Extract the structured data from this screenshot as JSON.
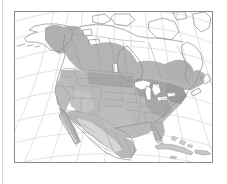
{
  "figure": {
    "type": "map",
    "title": "",
    "caption": "",
    "region": "North America",
    "projection": "conic",
    "background_color": "#ffffff",
    "frame_color": "#8a8a8a",
    "rule_color": "#d9d9d9"
  },
  "map": {
    "name": "north-america-distribution-map",
    "land_outline_color": "#8c8c8c",
    "boundary_color": "#9a9a9a",
    "graticule_color": "#dcdcdc",
    "ocean_color": "#ffffff",
    "lake_color": "#ffffff",
    "unshaded_land_color": "#ffffff",
    "shade_levels": [
      {
        "name": "range-dark",
        "color": "#a8a8a8"
      },
      {
        "name": "range-medium",
        "color": "#bdbdbd"
      },
      {
        "name": "range-light",
        "color": "#d2d2d2"
      }
    ],
    "features": [
      {
        "name": "alaska",
        "shaded": "partial"
      },
      {
        "name": "canada",
        "shaded": "partial"
      },
      {
        "name": "conterminous-united-states",
        "shaded": "full"
      },
      {
        "name": "mexico",
        "shaded": "partial"
      },
      {
        "name": "great-lakes",
        "shaded": "none"
      },
      {
        "name": "cuba",
        "shaded": "light"
      },
      {
        "name": "hispaniola",
        "shaded": "light"
      },
      {
        "name": "bahamas",
        "shaded": "light"
      },
      {
        "name": "greenland-edge",
        "shaded": "none"
      }
    ],
    "graticule": {
      "meridian_count": 9,
      "parallel_count": 8,
      "visible": true
    }
  }
}
